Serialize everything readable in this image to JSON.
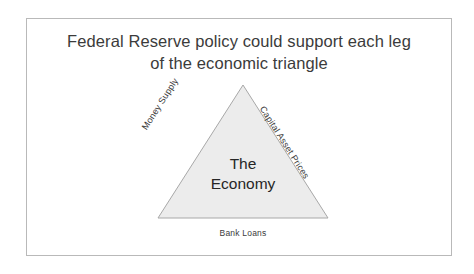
{
  "slide": {
    "title": {
      "lines": [
        "Federal Reserve policy could support each leg",
        "of the economic triangle"
      ]
    },
    "diagram": {
      "type": "triangle-concept",
      "shape_name": "triangle",
      "center_label": {
        "lines": [
          "The",
          "Economy"
        ]
      },
      "edge_labels": {
        "left_leg": "Money Supply",
        "right_leg": "Capital Asset Prices",
        "base": "Bank Loans"
      },
      "geometry": {
        "apex": [
          103,
          9
        ],
        "base_left": [
          18,
          142
        ],
        "base_right": [
          188,
          142
        ]
      }
    },
    "colors": {
      "background": "#ffffff",
      "frame_border": "#b9b9b9",
      "triangle_fill": "#ececec",
      "triangle_stroke": "#a8a8a8",
      "title_text": "#3b3b3b",
      "center_text": "#262626",
      "label_text": "#3b3b3b"
    }
  }
}
